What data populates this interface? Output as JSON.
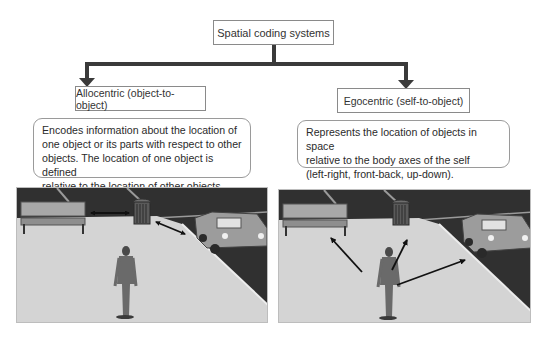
{
  "root": {
    "label": "Spatial coding systems"
  },
  "branches": [
    {
      "title": "Allocentric (object-to-object)",
      "description_lines": [
        "Encodes information about the location of",
        "one object or its parts with respect to other",
        "objects. The location of one object is defined",
        "relative to the location of other objects."
      ],
      "scene": {
        "objects": [
          "bench",
          "trash-can",
          "car",
          "person"
        ],
        "arrows": [
          "bench-to-trash-can",
          "trash-can-to-car"
        ]
      }
    },
    {
      "title": "Egocentric (self-to-object)",
      "description_lines": [
        "Represents the location of objects in space",
        "relative to the body axes of the self",
        "(left-right, front-back, up-down)."
      ],
      "scene": {
        "objects": [
          "bench",
          "trash-can",
          "car",
          "person"
        ],
        "arrows": [
          "person-to-bench",
          "person-to-trash-can",
          "person-to-car"
        ]
      }
    }
  ],
  "colors": {
    "connector": "#3a3a3a",
    "box_border": "#8a8a8a",
    "asphalt": "#2e2e2e",
    "pavement": "#d6d6d6"
  }
}
